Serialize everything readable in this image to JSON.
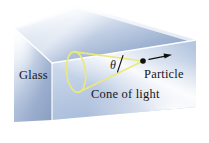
{
  "figure": {
    "kind": "physics-diagram",
    "background_color": "#ffffff"
  },
  "labels": {
    "glass": "Glass",
    "particle": "Particle",
    "cone": "Cone of light",
    "theta": "θ"
  },
  "block": {
    "name": "glass-block",
    "face_colors": {
      "top_light": "#fdfeff",
      "top_mid": "#c9d6ea",
      "top_dark": "#93a8c8",
      "left_light": "#eef3fa",
      "left_mid": "#b6c4dd",
      "left_dark": "#8fa2c2",
      "front_light": "#ffffff",
      "front_mid": "#c2d0e6",
      "front_dark": "#8295b8"
    },
    "edge_color": "#ffffff"
  },
  "cone": {
    "name": "cone-of-light",
    "stroke_color": "#e8e87a",
    "stroke_width": 1.6,
    "apex": {
      "x": 143,
      "y": 61
    },
    "base_center": {
      "x": 76,
      "y": 72
    },
    "base_rx": 9,
    "base_ry": 20
  },
  "particle": {
    "name": "particle-dot",
    "color": "#111111",
    "x": 143,
    "y": 61,
    "radius": 2.6
  },
  "arrow": {
    "name": "velocity-arrow",
    "color": "#111111",
    "from": {
      "x": 149,
      "y": 59
    },
    "to": {
      "x": 171,
      "y": 55
    }
  },
  "axis_line": {
    "name": "cone-axis-line",
    "color": "#111111",
    "from": {
      "x": 122,
      "y": 57
    },
    "to": {
      "x": 118,
      "y": 71
    }
  }
}
